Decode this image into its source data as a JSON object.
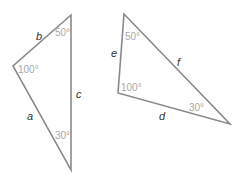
{
  "diagram": {
    "type": "geometry-triangles",
    "colors": {
      "edge": "#8a8a8a",
      "side_label": "#333333",
      "angle_label": "#a8a8a8",
      "background": "#ffffff"
    },
    "triangles": [
      {
        "name": "triangle-abc",
        "vertices": [
          [
            71,
            15
          ],
          [
            13,
            66
          ],
          [
            71,
            170
          ]
        ],
        "sides": {
          "a": "a",
          "b": "b",
          "c": "c"
        },
        "angles": {
          "top": "50°",
          "left": "100°",
          "bottom": "30°"
        }
      },
      {
        "name": "triangle-def",
        "vertices": [
          [
            124,
            14
          ],
          [
            118,
            93
          ],
          [
            230,
            124
          ]
        ],
        "sides": {
          "d": "d",
          "e": "e",
          "f": "f"
        },
        "angles": {
          "top": "50°",
          "left": "100°",
          "right": "30°"
        }
      }
    ]
  }
}
